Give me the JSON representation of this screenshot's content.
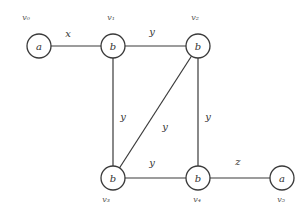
{
  "diagram": {
    "type": "graph",
    "nodes": [
      {
        "id": "v0",
        "name": "v₀",
        "label": "a",
        "x": 39,
        "y": 46
      },
      {
        "id": "v1",
        "name": "v₁",
        "label": "b",
        "x": 113,
        "y": 46
      },
      {
        "id": "v2",
        "name": "v₂",
        "label": "b",
        "x": 198,
        "y": 46
      },
      {
        "id": "v3",
        "name": "v₃",
        "label": "b",
        "x": 113,
        "y": 178
      },
      {
        "id": "v4",
        "name": "v₄",
        "label": "b",
        "x": 198,
        "y": 178
      },
      {
        "id": "v5",
        "name": "v₅",
        "label": "a",
        "x": 282,
        "y": 178
      }
    ],
    "edges": [
      {
        "from": "v0",
        "to": "v1",
        "label": "x",
        "lx": 68,
        "ly": 37
      },
      {
        "from": "v1",
        "to": "v2",
        "label": "y",
        "lx": 152,
        "ly": 35
      },
      {
        "from": "v1",
        "to": "v3",
        "label": "y",
        "lx": 123,
        "ly": 120
      },
      {
        "from": "v2",
        "to": "v3",
        "label": "y",
        "lx": 165,
        "ly": 130
      },
      {
        "from": "v2",
        "to": "v4",
        "label": "y",
        "lx": 208,
        "ly": 120
      },
      {
        "from": "v3",
        "to": "v4",
        "label": "y",
        "lx": 152,
        "ly": 166
      },
      {
        "from": "v4",
        "to": "v5",
        "label": "z",
        "lx": 238,
        "ly": 165
      }
    ]
  }
}
